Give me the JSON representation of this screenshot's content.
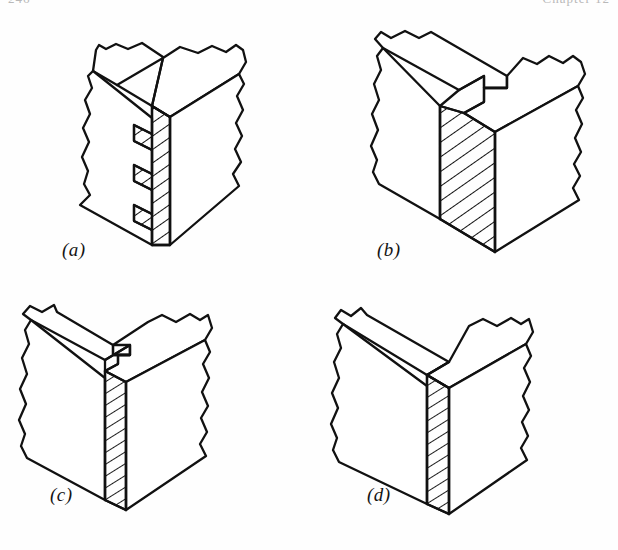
{
  "page": {
    "background_color": "#fefefe",
    "ink_color": "#111111",
    "running_head_left": "246",
    "running_head_right": "Chapter 12"
  },
  "figure": {
    "panel_count": 4,
    "panels": [
      {
        "id": "a",
        "caption": "(a)",
        "joint_name": "finger (box) joint",
        "description": "Interlocking square fingers on the mating end grain",
        "finger_count": 4,
        "has_hatched_end_grain": true,
        "has_break_lines": true
      },
      {
        "id": "b",
        "caption": "(b)",
        "joint_name": "rabbet (lap) joint",
        "description": "Stepped rabbet cut with wide hatched end grain face",
        "finger_count": 1,
        "has_hatched_end_grain": true,
        "has_break_lines": true
      },
      {
        "id": "c",
        "caption": "(c)",
        "joint_name": "shouldered butt joint",
        "description": "Small shoulder notch with narrow hatched end grain strip",
        "finger_count": 1,
        "has_hatched_end_grain": true,
        "has_break_lines": true
      },
      {
        "id": "d",
        "caption": "(d)",
        "joint_name": "plain butt joint",
        "description": "Plain square butt with narrow hatched end grain strip",
        "finger_count": 0,
        "has_hatched_end_grain": true,
        "has_break_lines": true
      }
    ]
  }
}
